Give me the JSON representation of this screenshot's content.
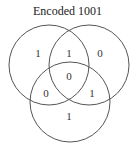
{
  "title": "Encoded 1001",
  "circles": [
    {
      "name": "left",
      "cx": 49,
      "cy": 65,
      "r": 40
    },
    {
      "name": "right",
      "cx": 89,
      "cy": 65,
      "r": 40
    },
    {
      "name": "bottom",
      "cx": 70,
      "cy": 102,
      "r": 40
    }
  ],
  "regions": {
    "left_only": "1",
    "left_right": "1",
    "right_only": "0",
    "center": "0",
    "left_bottom": "0",
    "right_bottom": "1",
    "bottom_only": "1"
  },
  "colors": {
    "stroke": "#555555",
    "text": "#333333"
  }
}
